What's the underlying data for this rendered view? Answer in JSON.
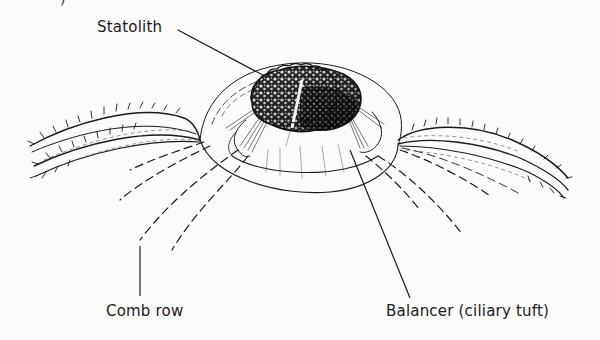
{
  "diagram": {
    "style": "black ink line illustration on white",
    "colors": {
      "ink": "#1a1a1a",
      "background": "#fbfbfa"
    },
    "labels": {
      "statolith": "Statolith",
      "comb_row": "Comb row",
      "balancer": "Balancer (ciliary tuft)"
    },
    "edge_fragment": ")",
    "structures": [
      {
        "id": "statolith",
        "description": "granular dark mass atop the dome"
      },
      {
        "id": "dome",
        "description": "transparent bell-shaped capsule"
      },
      {
        "id": "balancers",
        "description": "four ciliary tufts supporting statolith"
      },
      {
        "id": "ciliated-grooves-left",
        "description": "two hairy curved bands extending left"
      },
      {
        "id": "ciliated-grooves-right",
        "description": "two hairy curved bands extending right"
      },
      {
        "id": "comb-rows",
        "description": "dashed lines radiating downward"
      }
    ]
  }
}
